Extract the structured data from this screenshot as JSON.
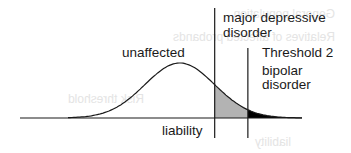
{
  "diagram": {
    "axis_label": "liability",
    "regions": {
      "unaffected": "unaffected",
      "threshold1_label_line1": "major depressive",
      "threshold1_label_line2": "disorder",
      "threshold2_title": "Threshold 2",
      "threshold2_label_line1": "bipolar",
      "threshold2_label_line2": "disorder"
    },
    "distribution": {
      "type": "normal",
      "mean": 0,
      "sd": 1,
      "x_range": [
        -3.2,
        3.5
      ],
      "threshold_1": 1.0,
      "threshold_2": 1.95
    },
    "colors": {
      "line": "#1a1a1a",
      "threshold1_fill": "#b3b3b3",
      "threshold2_fill": "#000000"
    },
    "ghost_text": {
      "line1": "General population",
      "line2": "Relatives of affected probands",
      "line3": "Risk threshold",
      "line4": "liability"
    }
  }
}
